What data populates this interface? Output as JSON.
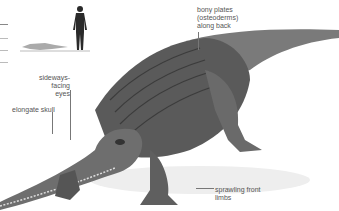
{
  "labels": {
    "plates": [
      "bony plates",
      "(osteoderms)",
      "along back"
    ],
    "eyes": [
      "sideways-facing",
      "eyes"
    ],
    "skull": "elongate skull",
    "limbs": [
      "sprawling front",
      "limbs"
    ]
  },
  "colors": {
    "background": "#ffffff",
    "body_dark": "#3a3a3a",
    "body_mid": "#7a7a7a",
    "body_light": "#b5b5b5",
    "label_text": "#555555"
  }
}
